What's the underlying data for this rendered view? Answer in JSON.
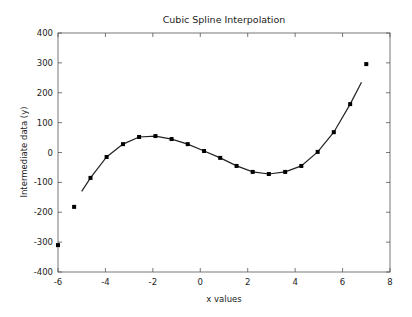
{
  "chart_data": {
    "type": "line",
    "title": "Cubic Spline Interpolation",
    "xlabel": "x values",
    "ylabel": "Intermediate data (y)",
    "xlim": [
      -6,
      8
    ],
    "ylim": [
      -400,
      400
    ],
    "xticks": [
      -6,
      -4,
      -2,
      0,
      2,
      4,
      6,
      8
    ],
    "yticks": [
      -400,
      -300,
      -200,
      -100,
      0,
      100,
      200,
      300,
      400
    ],
    "grid": false,
    "legend": null,
    "series": [
      {
        "name": "data points",
        "kind": "scatter",
        "color": "#000000",
        "x": [
          -6.0,
          -5.32,
          -4.63,
          -3.95,
          -3.26,
          -2.58,
          -1.89,
          -1.21,
          -0.53,
          0.16,
          0.84,
          1.53,
          2.21,
          2.89,
          3.58,
          4.26,
          4.95,
          5.63,
          6.32,
          7.0
        ],
        "y": [
          -310,
          -182,
          -85,
          -15,
          28,
          52,
          55,
          45,
          28,
          5,
          -18,
          -45,
          -65,
          -72,
          -65,
          -45,
          2,
          68,
          162,
          296
        ]
      },
      {
        "name": "cubic spline",
        "kind": "line",
        "color": "#000000",
        "x": [
          -5.0,
          -4.63,
          -3.95,
          -3.26,
          -2.58,
          -1.89,
          -1.21,
          -0.53,
          0.16,
          0.84,
          1.53,
          2.21,
          2.89,
          3.58,
          4.26,
          4.95,
          5.63,
          6.32,
          6.8
        ],
        "y": [
          -130,
          -85,
          -15,
          28,
          52,
          55,
          45,
          28,
          5,
          -18,
          -45,
          -65,
          -72,
          -65,
          -45,
          2,
          68,
          162,
          235
        ]
      }
    ]
  }
}
